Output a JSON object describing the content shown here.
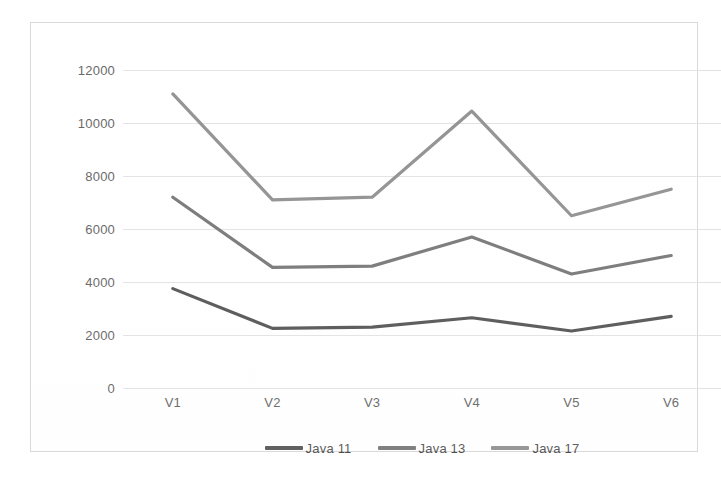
{
  "chart_data": {
    "type": "line",
    "title": "",
    "subtitle": "",
    "xlabel": "",
    "ylabel": "",
    "categories": [
      "V1",
      "V2",
      "V3",
      "V4",
      "V5",
      "V6"
    ],
    "ylim": [
      0,
      12000
    ],
    "ytick_labels": [
      "0",
      "2000",
      "4000",
      "6000",
      "8000",
      "10000",
      "12000"
    ],
    "ytick_values": [
      0,
      2000,
      4000,
      6000,
      8000,
      10000,
      12000
    ],
    "grid": true,
    "legend_position": "bottom",
    "series": [
      {
        "name": "Java 11",
        "color": "#4f4f4f",
        "values": [
          3750,
          2250,
          2300,
          2650,
          2150,
          2700
        ]
      },
      {
        "name": "Java 13",
        "color": "#737373",
        "values": [
          7200,
          4550,
          4600,
          5700,
          4300,
          5000
        ]
      },
      {
        "name": "Java 17",
        "color": "#8d8d8d",
        "values": [
          11100,
          7100,
          7200,
          10450,
          6500,
          7500
        ]
      }
    ]
  },
  "legend": {
    "items": [
      {
        "label": "Java 11",
        "color": "#4f4f4f"
      },
      {
        "label": "Java 13",
        "color": "#737373"
      },
      {
        "label": "Java 17",
        "color": "#8d8d8d"
      }
    ]
  },
  "axes": {
    "y_ticks": [
      "12000",
      "10000",
      "8000",
      "6000",
      "4000",
      "2000",
      "0"
    ],
    "x_ticks": [
      "V1",
      "V2",
      "V3",
      "V4",
      "V5",
      "V6"
    ]
  },
  "colors": {
    "gridline": "#e2e2e2",
    "axis_text": "#5e5e5e",
    "frame": "#d9d9d9",
    "background": "#ffffff"
  }
}
